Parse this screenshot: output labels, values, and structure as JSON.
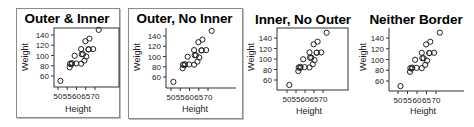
{
  "chart_data": [
    {
      "type": "scatter",
      "title": "Outer & Inner",
      "xlabel": "Height",
      "ylabel": "Weight",
      "xticks": [
        50,
        55,
        60,
        65,
        70
      ],
      "yticks": [
        60,
        80,
        100,
        120,
        140
      ],
      "outer_border": true,
      "inner_border": true,
      "grid": false,
      "x": [
        69.0,
        56.5,
        65.3,
        62.8,
        63.5,
        57.3,
        59.8,
        62.5,
        62.5,
        59.0,
        51.3,
        64.3,
        56.3,
        66.5,
        72.0,
        64.8,
        67.0,
        57.5,
        66.5
      ],
      "y": [
        112.5,
        84.0,
        98.0,
        102.5,
        102.5,
        83.0,
        84.5,
        112.5,
        84.0,
        99.5,
        50.5,
        90.0,
        77.0,
        112.0,
        150.0,
        128.0,
        133.0,
        85.0,
        112.0
      ]
    },
    {
      "type": "scatter",
      "title": "Outer, No Inner",
      "xlabel": "Height",
      "ylabel": "Weight",
      "xticks": [
        50,
        55,
        60,
        65,
        70
      ],
      "yticks": [
        60,
        80,
        100,
        120,
        140
      ],
      "outer_border": true,
      "inner_border": false,
      "grid": false,
      "x": [
        69.0,
        56.5,
        65.3,
        62.8,
        63.5,
        57.3,
        59.8,
        62.5,
        62.5,
        59.0,
        51.3,
        64.3,
        56.3,
        66.5,
        72.0,
        64.8,
        67.0,
        57.5,
        66.5
      ],
      "y": [
        112.5,
        84.0,
        98.0,
        102.5,
        102.5,
        83.0,
        84.5,
        112.5,
        84.0,
        99.5,
        50.5,
        90.0,
        77.0,
        112.0,
        150.0,
        128.0,
        133.0,
        85.0,
        112.0
      ]
    },
    {
      "type": "scatter",
      "title": "Inner, No Outer",
      "xlabel": "Height",
      "ylabel": "Weight",
      "xticks": [
        50,
        55,
        60,
        65,
        70
      ],
      "yticks": [
        60,
        80,
        100,
        120,
        140
      ],
      "outer_border": false,
      "inner_border": true,
      "grid": false,
      "x": [
        69.0,
        56.5,
        65.3,
        62.8,
        63.5,
        57.3,
        59.8,
        62.5,
        62.5,
        59.0,
        51.3,
        64.3,
        56.3,
        66.5,
        72.0,
        64.8,
        67.0,
        57.5,
        66.5
      ],
      "y": [
        112.5,
        84.0,
        98.0,
        102.5,
        102.5,
        83.0,
        84.5,
        112.5,
        84.0,
        99.5,
        50.5,
        90.0,
        77.0,
        112.0,
        150.0,
        128.0,
        133.0,
        85.0,
        112.0
      ]
    },
    {
      "type": "scatter",
      "title": "Neither Border",
      "xlabel": "Height",
      "ylabel": "Weight",
      "xticks": [
        50,
        55,
        60,
        65,
        70
      ],
      "yticks": [
        60,
        80,
        100,
        120,
        140
      ],
      "outer_border": false,
      "inner_border": false,
      "grid": false,
      "x": [
        69.0,
        56.5,
        65.3,
        62.8,
        63.5,
        57.3,
        59.8,
        62.5,
        62.5,
        59.0,
        51.3,
        64.3,
        56.3,
        66.5,
        72.0,
        64.8,
        67.0,
        57.5,
        66.5
      ],
      "y": [
        112.5,
        84.0,
        98.0,
        102.5,
        102.5,
        83.0,
        84.5,
        112.5,
        84.0,
        99.5,
        50.5,
        90.0,
        77.0,
        112.0,
        150.0,
        128.0,
        133.0,
        85.0,
        112.0
      ]
    }
  ],
  "colors": {
    "marker_stroke": "#222222",
    "axis": "#333333",
    "outer_border": "#8a8a8a",
    "background": "#ffffff"
  },
  "panels": [
    {
      "title": "Outer & Inner",
      "xlabel": "Height",
      "ylabel": "Weight"
    },
    {
      "title": "Outer, No Inner",
      "xlabel": "Height",
      "ylabel": "Weight"
    },
    {
      "title": "Inner, No Outer",
      "xlabel": "Height",
      "ylabel": "Weight"
    },
    {
      "title": "Neither Border",
      "xlabel": "Height",
      "ylabel": "Weight"
    }
  ]
}
